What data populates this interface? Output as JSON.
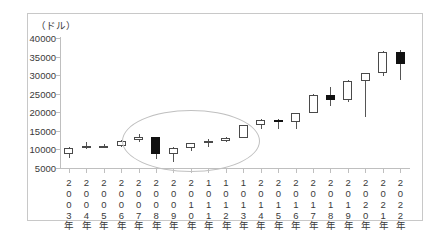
{
  "chart_data": {
    "type": "candlestick",
    "title": "",
    "unit_label": "（ドル）",
    "xlabel": "",
    "ylabel": "",
    "ylim": [
      5000,
      40000
    ],
    "ytick_step": 5000,
    "yticks": [
      "40000",
      "35000",
      "30000",
      "25000",
      "20000",
      "15000",
      "10000",
      "5000"
    ],
    "grid": false,
    "legend": "none",
    "categories": [
      "2003年",
      "2004年",
      "2005年",
      "2006年",
      "2007年",
      "2008年",
      "2009年",
      "2010年",
      "1011年",
      "1012年",
      "1013年",
      "2014年",
      "2015年",
      "2016年",
      "2017年",
      "2018年",
      "2019年",
      "2020年",
      "2021年",
      "2022年"
    ],
    "ohlc": [
      {
        "label": "2003年",
        "open": 8700,
        "high": 10700,
        "low": 7700,
        "close": 10400,
        "direction": "up"
      },
      {
        "label": "2004年",
        "open": 10400,
        "high": 11900,
        "low": 10100,
        "close": 10800,
        "direction": "up"
      },
      {
        "label": "2005年",
        "open": 10800,
        "high": 11500,
        "low": 10400,
        "close": 10800,
        "direction": "up"
      },
      {
        "label": "2006年",
        "open": 10800,
        "high": 12500,
        "low": 10700,
        "close": 12400,
        "direction": "up"
      },
      {
        "label": "2007年",
        "open": 12400,
        "high": 14200,
        "low": 12100,
        "close": 13300,
        "direction": "up"
      },
      {
        "label": "2008年",
        "open": 13300,
        "high": 13400,
        "low": 7400,
        "close": 8800,
        "direction": "down"
      },
      {
        "label": "2009年",
        "open": 8800,
        "high": 10700,
        "low": 6500,
        "close": 10400,
        "direction": "up"
      },
      {
        "label": "2010年",
        "open": 10400,
        "high": 11700,
        "low": 9600,
        "close": 11600,
        "direction": "up"
      },
      {
        "label": "1011年",
        "open": 11600,
        "high": 12900,
        "low": 10600,
        "close": 12200,
        "direction": "up"
      },
      {
        "label": "1012年",
        "open": 12200,
        "high": 13400,
        "low": 12100,
        "close": 13100,
        "direction": "up"
      },
      {
        "label": "1013年",
        "open": 13100,
        "high": 16600,
        "low": 13000,
        "close": 16500,
        "direction": "up"
      },
      {
        "label": "2014年",
        "open": 16500,
        "high": 18100,
        "low": 15400,
        "close": 17800,
        "direction": "up"
      },
      {
        "label": "2015年",
        "open": 17800,
        "high": 18300,
        "low": 15600,
        "close": 17400,
        "direction": "down"
      },
      {
        "label": "2016年",
        "open": 17400,
        "high": 19900,
        "low": 15500,
        "close": 19800,
        "direction": "up"
      },
      {
        "label": "2017年",
        "open": 19800,
        "high": 24800,
        "low": 19700,
        "close": 24700,
        "direction": "up"
      },
      {
        "label": "2018年",
        "open": 24700,
        "high": 26900,
        "low": 21700,
        "close": 23300,
        "direction": "down"
      },
      {
        "label": "2019年",
        "open": 23300,
        "high": 28600,
        "low": 22700,
        "close": 28500,
        "direction": "up"
      },
      {
        "label": "2020年",
        "open": 28500,
        "high": 30600,
        "low": 18600,
        "close": 30600,
        "direction": "up"
      },
      {
        "label": "2021年",
        "open": 30600,
        "high": 36500,
        "low": 29900,
        "close": 36300,
        "direction": "up"
      },
      {
        "label": "2022年",
        "open": 36300,
        "high": 36800,
        "low": 28700,
        "close": 33100,
        "direction": "down"
      }
    ],
    "annotations": [
      {
        "type": "ellipse",
        "name": "highlight-ellipse",
        "covers": [
          "2007年",
          "2008年",
          "2009年",
          "2010年",
          "1011年",
          "1012年",
          "1013年"
        ],
        "color": "#c0c0c0"
      }
    ],
    "colors": {
      "up_body": "#ffffff",
      "down_body": "#111111",
      "outline": "#4a4a4a",
      "axis": "#bfbfbf",
      "text": "#3a3a3a",
      "frame": "#c8c8c8",
      "annotation": "#c0c0c0"
    }
  }
}
